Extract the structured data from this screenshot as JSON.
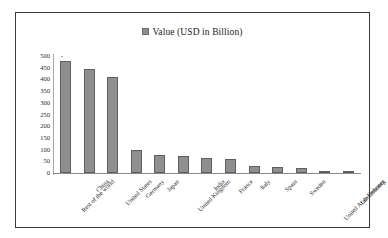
{
  "chart_data": {
    "type": "bar",
    "title": "",
    "subtitle": "",
    "xlabel": "",
    "ylabel": "",
    "ylim": [
      0,
      500
    ],
    "ytick_step": 50,
    "yticks": [
      "500",
      "450",
      "400",
      "350",
      "300",
      "250",
      "200",
      "150",
      "100",
      "50",
      "0"
    ],
    "grid": false,
    "legend_position": "top-center",
    "legend": [
      "Value (USD in Billion)"
    ],
    "categories": [
      "Rest of the world",
      "China",
      "United States",
      "Germany",
      "Japan",
      "United Kingdom",
      "India",
      "France",
      "Italy",
      "Spain",
      "Sweden",
      "United Arab Emirates",
      "Luxembourg"
    ],
    "series": [
      {
        "name": "Value (USD in Billion)",
        "values": [
          480,
          443,
          410,
          100,
          75,
          72,
          65,
          62,
          30,
          27,
          22,
          10,
          5
        ]
      }
    ]
  },
  "legend": {
    "label": "Value (USD in Billion)",
    "marker": "legend-square-marker"
  },
  "colors": {
    "bar_fill": "#8f8f8f",
    "bar_border": "#5e5e5e",
    "frame_border": "#3a3a3a",
    "axis": "#8a8a8a",
    "text": "#1b1b1b",
    "background": "#ffffff"
  }
}
